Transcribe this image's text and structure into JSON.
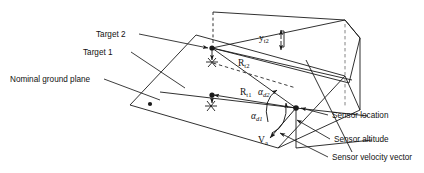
{
  "figure": {
    "type": "technical-line-diagram",
    "background": "#ffffff",
    "line_color": "#1a1a1a",
    "text_color": "#111111",
    "width": 424,
    "height": 173
  },
  "labels": {
    "target2": "Target 2",
    "target1": "Target 1",
    "ground_plane": "Nominal ground plane",
    "sensor_location": "Sensor location",
    "sensor_altitude": "Sensor altitude",
    "sensor_velocity": "Sensor velocity vector"
  },
  "math_labels": {
    "y_t2": {
      "base": "y",
      "sub": "t2"
    },
    "r_t2": {
      "base": "R",
      "sub": "t2"
    },
    "r_t1": {
      "base": "R",
      "sub": "t1"
    },
    "alpha_d2": {
      "base": "α",
      "sub": "d2"
    },
    "alpha_d1": {
      "base": "α",
      "sub": "d1"
    },
    "v_a": {
      "base": "V",
      "sub": "a"
    }
  },
  "markers": {
    "target2_point": "filled-dot",
    "target1_point": "filled-dot",
    "sensor_point": "filled-dot",
    "ground_corner_point": "filled-dot",
    "target2_ground_projection": "asterisk-marker",
    "target1_ground_projection": "asterisk-marker"
  },
  "geometry": {
    "ground_plane_corners": [
      [
        130,
        105
      ],
      [
        196,
        35
      ],
      [
        345,
        76
      ],
      [
        278,
        148
      ]
    ],
    "target2": [
      212,
      48
    ],
    "target1": [
      212,
      95
    ],
    "sensor": [
      296,
      108
    ],
    "sensor_ground": [
      296,
      148
    ],
    "vertical_plane_apex": [
      345,
      20
    ],
    "vertical_plane_right_top": [
      360,
      38
    ],
    "vertical_plane_right_bottom": [
      360,
      110
    ]
  }
}
